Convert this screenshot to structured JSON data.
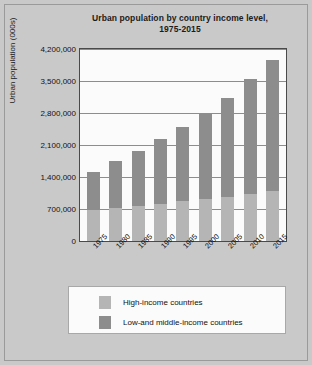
{
  "chart_data": {
    "type": "bar",
    "subtype": "stacked-bar",
    "title": "Urban population by country income level, 1975-2015",
    "title_line1": "Urban population by country income level,",
    "title_line2": "1975-2015",
    "xlabel": "",
    "ylabel": "Urban population (000s)",
    "ylim": [
      0,
      4200000
    ],
    "grid": true,
    "legend_position": "bottom",
    "categories": [
      "1975",
      "1980",
      "1985",
      "1990",
      "1995",
      "2000",
      "2005",
      "2010",
      "2015"
    ],
    "ytick_labels": [
      "0",
      "700,000",
      "1,400,000",
      "2,100,000",
      "2,800,000",
      "3,500,000",
      "4,200,000"
    ],
    "ytick_values": [
      0,
      700000,
      1400000,
      2100000,
      2800000,
      3500000,
      4200000
    ],
    "series": [
      {
        "name": "High-income countries",
        "color": "#b5b5b5",
        "values": [
          680000,
          730000,
          770000,
          820000,
          870000,
          920000,
          970000,
          1030000,
          1090000
        ]
      },
      {
        "name": "Low-and middle-income countries",
        "color": "#8d8d8d",
        "values": [
          820000,
          1020000,
          1210000,
          1420000,
          1620000,
          1880000,
          2150000,
          2510000,
          2860000
        ]
      }
    ],
    "totals": [
      1500000,
      1750000,
      1980000,
      2240000,
      2490000,
      2800000,
      3120000,
      3540000,
      3950000
    ]
  },
  "legend": {
    "items": [
      {
        "label": "High-income countries",
        "color": "#b5b5b5"
      },
      {
        "label": "Low-and middle-income countries",
        "color": "#8d8d8d"
      }
    ]
  }
}
